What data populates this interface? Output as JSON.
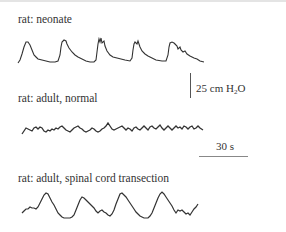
{
  "panels": [
    {
      "label": "rat: neonate"
    },
    {
      "label": "rat: adult, normal"
    },
    {
      "label": "rat: adult, spinal cord transection"
    }
  ],
  "scale": {
    "pressure_value": "25 cm H",
    "pressure_sub": "2",
    "pressure_tail": "O",
    "time": "30 s"
  },
  "colors": {
    "trace": "#333333",
    "scalebar": "#555555"
  }
}
